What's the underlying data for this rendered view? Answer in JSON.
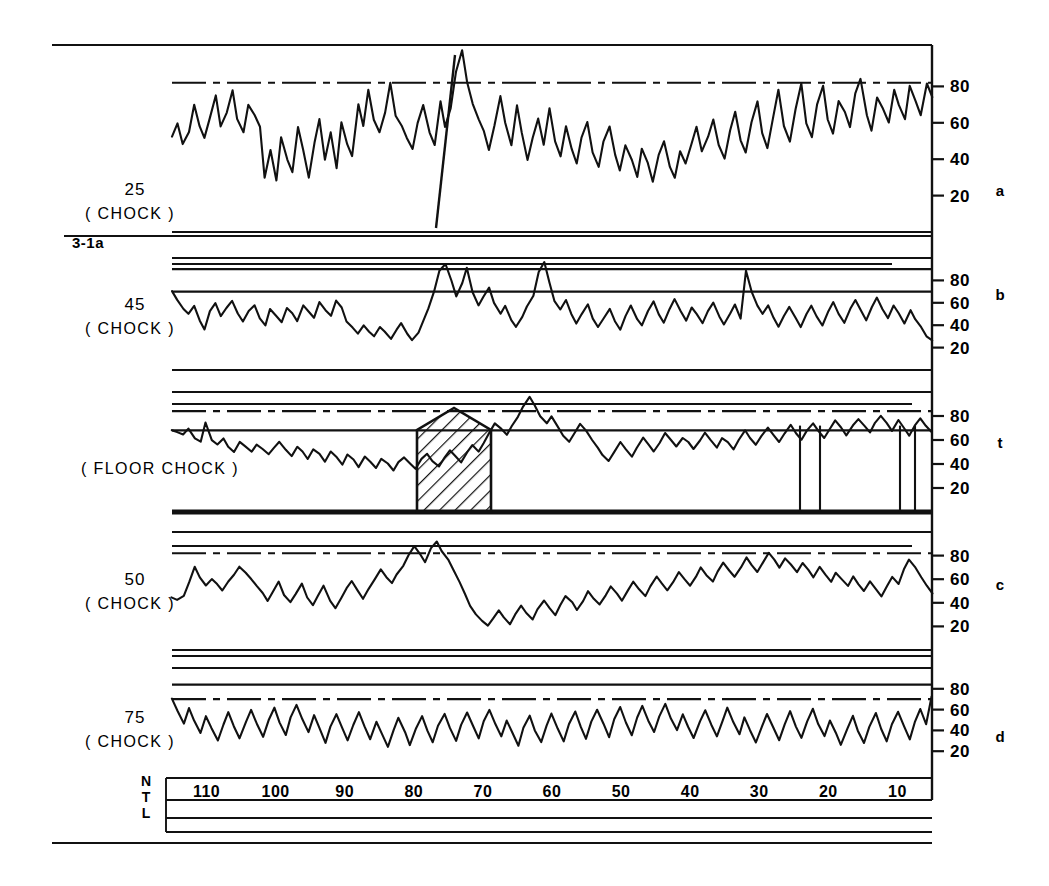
{
  "figure": {
    "id_label": "3-1a",
    "background": "#ffffff",
    "ink": "#111111",
    "width": 1049,
    "height": 886
  },
  "axis": {
    "y_ticks": [
      80,
      60,
      40,
      20
    ],
    "x_ticks": [
      110,
      100,
      90,
      80,
      70,
      60,
      50,
      40,
      30,
      20,
      10
    ],
    "x_left_labels": [
      "N",
      "T",
      "L"
    ]
  },
  "panels": [
    {
      "key": "a",
      "letter": "a",
      "number": "25",
      "sub": "( CHOCK )",
      "has_number": true
    },
    {
      "key": "b",
      "letter": "b",
      "number": "45",
      "sub": "( CHOCK )",
      "has_number": true
    },
    {
      "key": "t",
      "letter": "t",
      "number": "",
      "sub": "( FLOOR CHOCK )",
      "has_number": false
    },
    {
      "key": "c",
      "letter": "c",
      "number": "50",
      "sub": "( CHOCK )",
      "has_number": true
    },
    {
      "key": "d",
      "letter": "d",
      "number": "75",
      "sub": "( CHOCK )",
      "has_number": true
    }
  ],
  "chart_data": {
    "type": "line",
    "title": "",
    "subtitle": "",
    "xlabel": "",
    "ylabel": "",
    "grid": false,
    "legend": "none",
    "x_axis": {
      "ticks": [
        110,
        100,
        90,
        80,
        70,
        60,
        50,
        40,
        30,
        20,
        10
      ],
      "direction": "descending-left-to-right",
      "range": [
        115,
        5
      ],
      "row_labels": [
        "N",
        "T",
        "L"
      ]
    },
    "y_axis": {
      "ticks": [
        80,
        60,
        40,
        20
      ],
      "range": [
        0,
        100
      ],
      "shared_by_all_panels": true
    },
    "annotations": [
      {
        "type": "hatched-box",
        "panel": "t",
        "x_start": 68,
        "x_end": 60,
        "y_bottom": 0,
        "y_top": 88,
        "label": ""
      },
      {
        "type": "diagonal-line",
        "panel": "a",
        "note": "steep line crossing panel a"
      }
    ],
    "series": [
      {
        "name": "25 (CHOCK)",
        "panel": "a",
        "reference_lines": [
          {
            "level": 82,
            "style": "dash-dot"
          }
        ],
        "values": [
          52,
          60,
          48,
          55,
          70,
          58,
          52,
          63,
          75,
          58,
          66,
          78,
          62,
          55,
          70,
          64,
          58,
          30,
          45,
          28,
          52,
          40,
          33,
          58,
          45,
          30,
          50,
          62,
          40,
          55,
          35,
          60,
          48,
          42,
          70,
          58,
          78,
          62,
          55,
          66,
          82,
          64,
          58,
          52,
          46,
          60,
          70,
          55,
          48,
          72,
          58,
          68,
          88,
          100,
          82,
          70,
          62,
          55,
          45,
          58,
          75,
          60,
          48,
          70,
          55,
          40,
          52,
          62,
          48,
          68,
          50,
          42,
          58,
          46,
          38,
          52,
          60,
          44,
          36,
          50,
          58,
          42,
          34,
          48,
          40,
          30,
          46,
          38,
          28,
          42,
          50,
          36,
          30,
          44,
          38,
          48,
          58,
          44,
          52,
          62,
          48,
          40,
          56,
          66,
          50,
          44,
          60,
          72,
          54,
          46,
          62,
          78,
          58,
          50,
          68,
          82,
          60,
          52,
          70,
          80,
          62,
          54,
          72,
          66,
          58,
          76,
          84,
          64,
          56,
          74,
          68,
          60,
          78,
          70,
          62,
          80,
          72,
          64,
          82,
          74
        ]
      },
      {
        "name": "45 (CHOCK)",
        "panel": "b",
        "reference_lines": [
          {
            "level": 90,
            "style": "solid"
          },
          {
            "level": 70,
            "style": "solid"
          }
        ],
        "values": [
          70,
          62,
          55,
          50,
          58,
          44,
          36,
          52,
          60,
          48,
          55,
          62,
          50,
          44,
          52,
          58,
          46,
          40,
          54,
          48,
          42,
          56,
          50,
          44,
          58,
          52,
          46,
          60,
          54,
          48,
          62,
          56,
          44,
          38,
          32,
          40,
          34,
          30,
          38,
          34,
          28,
          36,
          42,
          32,
          26,
          34,
          44,
          55,
          70,
          88,
          95,
          80,
          66,
          78,
          92,
          70,
          58,
          66,
          74,
          60,
          50,
          58,
          44,
          38,
          48,
          56,
          66,
          88,
          96,
          78,
          62,
          54,
          62,
          50,
          42,
          50,
          58,
          46,
          38,
          46,
          54,
          44,
          36,
          48,
          58,
          46,
          40,
          52,
          62,
          50,
          42,
          54,
          64,
          52,
          44,
          56,
          50,
          42,
          52,
          60,
          48,
          40,
          50,
          58,
          46,
          88,
          70,
          58,
          50,
          58,
          46,
          38,
          48,
          56,
          46,
          38,
          50,
          58,
          48,
          40,
          52,
          60,
          50,
          42,
          54,
          62,
          52,
          44,
          56,
          64,
          54,
          46,
          58,
          50,
          42,
          54,
          46,
          38,
          30,
          26
        ]
      },
      {
        "name": "( FLOOR CHOCK )",
        "panel": "t",
        "reference_lines": [
          {
            "level": 84,
            "style": "dash-dot"
          },
          {
            "level": 68,
            "style": "solid"
          }
        ],
        "values": [
          68,
          66,
          64,
          70,
          62,
          58,
          74,
          60,
          56,
          62,
          54,
          50,
          58,
          54,
          50,
          56,
          52,
          48,
          54,
          58,
          52,
          46,
          54,
          50,
          44,
          52,
          48,
          42,
          50,
          46,
          40,
          48,
          44,
          38,
          46,
          42,
          36,
          44,
          40,
          34,
          42,
          46,
          40,
          36,
          44,
          48,
          42,
          38,
          46,
          52,
          46,
          42,
          50,
          56,
          50,
          58,
          66,
          74,
          70,
          64,
          72,
          80,
          88,
          96,
          88,
          80,
          74,
          80,
          72,
          64,
          58,
          66,
          74,
          68,
          60,
          54,
          48,
          42,
          50,
          58,
          52,
          46,
          54,
          62,
          56,
          50,
          58,
          66,
          60,
          54,
          62,
          58,
          52,
          60,
          66,
          60,
          54,
          62,
          58,
          52,
          60,
          68,
          62,
          56,
          64,
          70,
          64,
          58,
          66,
          72,
          66,
          60,
          68,
          74,
          68,
          62,
          70,
          76,
          70,
          64,
          72,
          78,
          72,
          66,
          74,
          80,
          74,
          68,
          76,
          70,
          64,
          72,
          78,
          72,
          66
        ]
      },
      {
        "name": "50 (CHOCK)",
        "panel": "c",
        "reference_lines": [
          {
            "level": 82,
            "style": "dash-dot"
          }
        ],
        "values": [
          44,
          42,
          46,
          58,
          70,
          62,
          54,
          60,
          56,
          50,
          58,
          64,
          70,
          66,
          60,
          54,
          48,
          42,
          50,
          58,
          46,
          40,
          48,
          56,
          44,
          38,
          46,
          54,
          42,
          36,
          44,
          52,
          58,
          50,
          44,
          52,
          60,
          68,
          62,
          56,
          64,
          72,
          80,
          88,
          82,
          74,
          86,
          92,
          84,
          76,
          68,
          58,
          48,
          38,
          30,
          24,
          20,
          26,
          34,
          28,
          22,
          30,
          38,
          32,
          26,
          34,
          42,
          36,
          30,
          38,
          46,
          40,
          34,
          42,
          50,
          44,
          38,
          46,
          54,
          48,
          42,
          50,
          58,
          52,
          46,
          54,
          62,
          56,
          50,
          58,
          66,
          60,
          54,
          62,
          70,
          64,
          58,
          66,
          74,
          68,
          62,
          70,
          78,
          72,
          66,
          74,
          82,
          76,
          70,
          78,
          72,
          66,
          74,
          68,
          62,
          70,
          64,
          58,
          66,
          60,
          54,
          62,
          56,
          50,
          58,
          52,
          46,
          54,
          62,
          56,
          68,
          76,
          70,
          62,
          54,
          48
        ]
      },
      {
        "name": "75 (CHOCK)",
        "panel": "d",
        "reference_lines": [
          {
            "level": 84,
            "style": "solid"
          },
          {
            "level": 70,
            "style": "dash-dot"
          }
        ],
        "values": [
          70,
          58,
          46,
          62,
          50,
          38,
          54,
          42,
          30,
          46,
          58,
          44,
          32,
          48,
          60,
          46,
          34,
          50,
          62,
          48,
          36,
          52,
          64,
          50,
          38,
          54,
          42,
          28,
          44,
          56,
          42,
          30,
          46,
          58,
          44,
          32,
          48,
          36,
          24,
          40,
          52,
          38,
          26,
          42,
          54,
          40,
          28,
          44,
          56,
          42,
          30,
          46,
          58,
          44,
          32,
          48,
          60,
          46,
          34,
          50,
          38,
          26,
          42,
          54,
          40,
          28,
          44,
          56,
          42,
          30,
          46,
          58,
          44,
          32,
          48,
          60,
          46,
          34,
          50,
          62,
          48,
          36,
          52,
          64,
          50,
          38,
          54,
          66,
          52,
          40,
          56,
          44,
          32,
          48,
          60,
          46,
          34,
          50,
          62,
          48,
          36,
          52,
          40,
          28,
          44,
          56,
          42,
          30,
          46,
          58,
          44,
          32,
          48,
          60,
          46,
          34,
          50,
          38,
          26,
          42,
          54,
          40,
          28,
          44,
          56,
          42,
          30,
          46,
          58,
          44,
          32,
          48,
          60,
          46,
          72
        ]
      }
    ]
  }
}
